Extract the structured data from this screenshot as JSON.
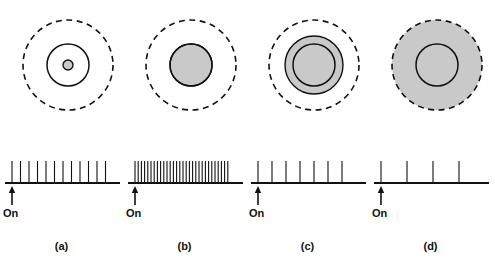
{
  "figure": {
    "width": 495,
    "height": 267,
    "background": "#ffffff",
    "ink_color": "#111111",
    "shade_color": "#c9c9c9",
    "stimulus_onset_label": "On"
  },
  "panels": [
    {
      "id": "a",
      "label": "(a)",
      "on_label": "On",
      "center_x": 68,
      "receptive_field": {
        "surround_dashed_radius": 45,
        "center_solid_radius": 21,
        "stimulus_spot_radius": 5,
        "stimulus_spot_shaded": true,
        "description": "tiny spot at center of excitatory center"
      },
      "spike_train": {
        "n_spikes": 12,
        "spike_height": 22,
        "first_spike_x": 12,
        "spacing": 8.5,
        "baseline_x0": 5,
        "baseline_x1": 120,
        "rate_label": "moderate"
      }
    },
    {
      "id": "b",
      "label": "(b)",
      "on_label": "On",
      "center_x": 68,
      "receptive_field": {
        "surround_dashed_radius": 45,
        "center_solid_radius": 21,
        "stimulus_spot_radius": 21,
        "stimulus_spot_shaded": true,
        "description": "spot exactly fills the excitatory center"
      },
      "spike_train": {
        "n_spikes": 30,
        "spike_height": 22,
        "first_spike_x": 12,
        "spacing": 3.2,
        "baseline_x0": 5,
        "baseline_x1": 120,
        "rate_label": "maximal"
      }
    },
    {
      "id": "c",
      "label": "(c)",
      "on_label": "On",
      "center_x": 68,
      "receptive_field": {
        "surround_dashed_radius": 45,
        "center_solid_radius": 21,
        "stimulus_spot_radius": 29,
        "stimulus_spot_shaded": true,
        "description": "spot overlaps center and part of inhibitory surround"
      },
      "spike_train": {
        "n_spikes": 7,
        "spike_height": 22,
        "first_spike_x": 12,
        "spacing": 14,
        "baseline_x0": 5,
        "baseline_x1": 120,
        "rate_label": "reduced"
      }
    },
    {
      "id": "d",
      "label": "(d)",
      "on_label": "On",
      "center_x": 68,
      "receptive_field": {
        "surround_dashed_radius": 45,
        "center_solid_radius": 21,
        "stimulus_spot_radius": 45,
        "stimulus_spot_shaded": true,
        "description": "spot covers the entire receptive field including full surround"
      },
      "spike_train": {
        "n_spikes": 4,
        "spike_height": 22,
        "first_spike_x": 12,
        "spacing": 26,
        "baseline_x0": 5,
        "baseline_x1": 120,
        "rate_label": "weak"
      }
    }
  ]
}
